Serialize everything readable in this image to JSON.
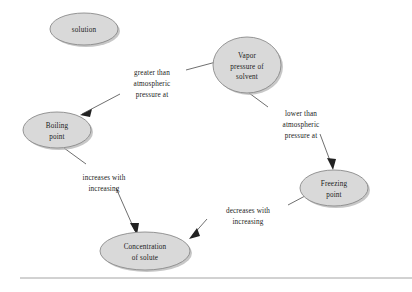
{
  "diagram": {
    "background_color": "#ffffff",
    "node_fill": "#d9d9d9",
    "node_stroke": "#8a8a8a",
    "edge_color": "#555555",
    "text_color": "#1a1a1a",
    "nodes": [
      {
        "id": "solution",
        "lines": [
          "solution"
        ],
        "cx": 84,
        "cy": 29,
        "rx": 34,
        "ry": 16
      },
      {
        "id": "vapor-pressure-of-solvent",
        "lines": [
          "Vapor",
          "pressure of",
          "solvent"
        ],
        "cx": 247,
        "cy": 65,
        "rx": 34,
        "ry": 28
      },
      {
        "id": "boiling-point",
        "lines": [
          "Boiling",
          "point"
        ],
        "cx": 57,
        "cy": 130,
        "rx": 34,
        "ry": 18
      },
      {
        "id": "freezing-point",
        "lines": [
          "Freezing",
          "point"
        ],
        "cx": 334,
        "cy": 188,
        "rx": 34,
        "ry": 18
      },
      {
        "id": "concentration-of-solute",
        "lines": [
          "Concentration",
          "of solute"
        ],
        "cx": 145,
        "cy": 251,
        "rx": 45,
        "ry": 19
      }
    ],
    "edges": [
      {
        "id": "vapor-to-boiling",
        "from": "vapor-pressure-of-solvent",
        "to": "boiling-point",
        "label_lines": [
          "greater than",
          "atmospheric",
          "pressure at"
        ],
        "label_x": 152,
        "label_y": 78
      },
      {
        "id": "vapor-to-freezing",
        "from": "vapor-pressure-of-solvent",
        "to": "freezing-point",
        "label_lines": [
          "lower than",
          "atmospheric",
          "pressure at"
        ],
        "label_x": 301,
        "label_y": 116
      },
      {
        "id": "boiling-to-concentration",
        "from": "boiling-point",
        "to": "concentration-of-solute",
        "label_lines": [
          "increases with",
          "increasing"
        ],
        "label_x": 104,
        "label_y": 178
      },
      {
        "id": "freezing-to-concentration",
        "from": "freezing-point",
        "to": "concentration-of-solute",
        "label_lines": [
          "decreases with",
          "increasing"
        ],
        "label_x": 248,
        "label_y": 211
      }
    ],
    "footer_rule": {
      "x1": 20,
      "x2": 412,
      "y": 278
    }
  }
}
